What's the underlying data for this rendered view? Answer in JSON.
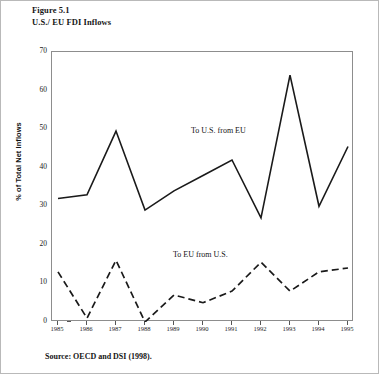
{
  "figure": {
    "title_line1": "Figure 5.1",
    "title_line2": "U.S./ EU FDI Inflows",
    "source": "Source: OECD and DSI  (1998)."
  },
  "chart_data": {
    "type": "line",
    "title": "U.S./ EU FDI Inflows",
    "xlabel": "",
    "ylabel": "% of Total Net Inflows",
    "ylim": [
      0,
      70
    ],
    "yticks": [
      0,
      10,
      20,
      30,
      40,
      50,
      60,
      70
    ],
    "grid": false,
    "legend_position": "inline-annotation",
    "categories": [
      "1985",
      "1986",
      "1987",
      "1988",
      "1989",
      "1990",
      "1991",
      "1992",
      "1993",
      "1994",
      "1995"
    ],
    "series": [
      {
        "name": "To U.S. from EU",
        "style": "solid",
        "color": "#1a1a1a",
        "values": [
          32,
          33,
          49.5,
          29,
          34,
          38,
          42,
          27,
          64,
          30,
          45.5
        ]
      },
      {
        "name": "To EU from U.S.",
        "style": "dashed",
        "color": "#1a1a1a",
        "values": [
          13,
          1,
          16,
          0,
          7,
          5,
          8,
          15.5,
          8,
          13,
          14
        ]
      }
    ],
    "annotations": [
      {
        "text": "To U.S. from EU",
        "x": "1989",
        "y": 51
      },
      {
        "text": "To EU from U.S.",
        "x": "1988.5",
        "y": 19
      }
    ]
  }
}
